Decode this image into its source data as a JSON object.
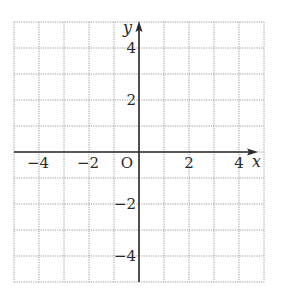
{
  "diagram": {
    "type": "coordinate-plane",
    "x_axis": {
      "name": "x",
      "min": -5,
      "max": 5,
      "labels": [
        {
          "value": -4,
          "text": "−4"
        },
        {
          "value": -2,
          "text": "−2"
        },
        {
          "value": 2,
          "text": "2"
        },
        {
          "value": 4,
          "text": "4"
        }
      ]
    },
    "y_axis": {
      "name": "y",
      "min": -5,
      "max": 5,
      "labels": [
        {
          "value": 4,
          "text": "4"
        },
        {
          "value": 2,
          "text": "2"
        },
        {
          "value": -2,
          "text": "−2"
        },
        {
          "value": -4,
          "text": "−4"
        }
      ]
    },
    "origin_label": "O",
    "grid": {
      "step": 1,
      "style": "dotted"
    },
    "colors": {
      "grid": "#9a9a9a",
      "axis": "#2a2a2a"
    }
  }
}
